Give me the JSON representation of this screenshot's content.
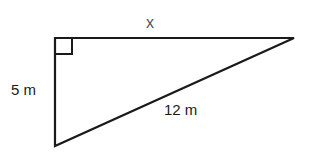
{
  "diagram": {
    "type": "right-triangle",
    "colors": {
      "stroke": "#1a1a1a",
      "background": "#ffffff"
    },
    "sides": {
      "top": {
        "label": "x"
      },
      "left": {
        "label": "5 m"
      },
      "hypotenuse": {
        "label": "12 m"
      }
    },
    "right_angle_marker": "square at top-left vertex"
  }
}
